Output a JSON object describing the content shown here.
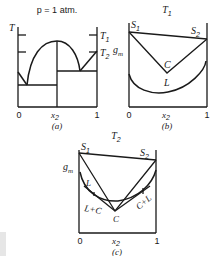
{
  "figure": {
    "panel_a": {
      "title": "p = 1 atm.",
      "y_axis_label": "T",
      "right_labels": [
        "T",
        "T"
      ],
      "right_label_subs": [
        "1",
        "2"
      ],
      "x_ticks": [
        "0",
        "x",
        "1"
      ],
      "x_var_sub": "2",
      "caption": "(a)"
    },
    "panel_b": {
      "title": "T",
      "title_sub": "1",
      "y_axis_label": "g",
      "y_axis_sub": "m",
      "labels": {
        "s1": "S",
        "s1_sub": "1",
        "s2": "S",
        "s2_sub": "2",
        "c": "C",
        "l": "L"
      },
      "x_ticks": [
        "0",
        "x",
        "1"
      ],
      "x_var_sub": "2",
      "caption": "(b)"
    },
    "panel_c": {
      "title": "T",
      "title_sub": "2",
      "y_axis_label": "g",
      "y_axis_sub": "m",
      "labels": {
        "s1": "S",
        "s1_sub": "1",
        "s2": "S",
        "s2_sub": "2",
        "c": "C",
        "l": "L",
        "l_plus_c": "L+C",
        "c_plus_l": "C+L"
      },
      "x_ticks": [
        "0",
        "x",
        "1"
      ],
      "x_var_sub": "2",
      "caption": "(c)"
    }
  }
}
